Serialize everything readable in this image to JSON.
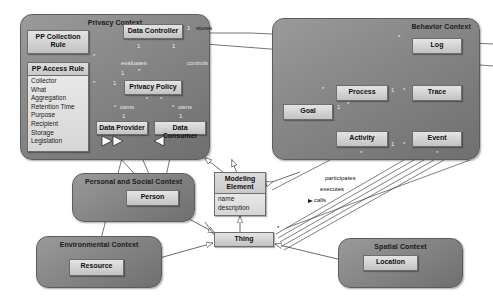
{
  "diagram": {
    "type": "uml-class-diagram",
    "colors": {
      "context_panel": "#8a8a8a",
      "class_box": "#d2d2d2",
      "border": "#6d6d6d",
      "background": "#ffffff",
      "label_text": "#101010",
      "label_text_on_dark": "#e8e8e8"
    }
  },
  "contexts": [
    {
      "id": "privacy",
      "title": "Privacy Context"
    },
    {
      "id": "behavior",
      "title": "Behavior Context"
    },
    {
      "id": "personal",
      "title": "Personal and Social Context"
    },
    {
      "id": "environmental",
      "title": "Environmental Context"
    },
    {
      "id": "spatial",
      "title": "Spatial Context"
    }
  ],
  "classes": {
    "pp_collection_rule": {
      "name": "PP Collection Rule",
      "attributes": []
    },
    "pp_access_rule": {
      "name": "PP Access Rule",
      "attributes": [
        "Collector",
        "What",
        "Aggregation",
        "Retention Time",
        "Purpose",
        "Recipient",
        "Storage",
        "Legislation"
      ]
    },
    "data_controller": {
      "name": "Data Controller",
      "attributes": []
    },
    "privacy_policy": {
      "name": "Privacy Policy",
      "attributes": []
    },
    "data_provider": {
      "name": "Data Provider",
      "attributes": []
    },
    "data_consumer": {
      "name": "Data Consumer",
      "attributes": []
    },
    "goal": {
      "name": "Goal",
      "attributes": []
    },
    "process": {
      "name": "Process",
      "attributes": []
    },
    "activity": {
      "name": "Activity",
      "attributes": []
    },
    "log": {
      "name": "Log",
      "attributes": []
    },
    "trace": {
      "name": "Trace",
      "attributes": []
    },
    "event": {
      "name": "Event",
      "attributes": []
    },
    "person": {
      "name": "Person",
      "attributes": []
    },
    "resource": {
      "name": "Resource",
      "attributes": []
    },
    "location": {
      "name": "Location",
      "attributes": []
    },
    "modeling_element": {
      "name": "Modeling Element",
      "attributes": [
        "name",
        "description"
      ]
    },
    "thing": {
      "name": "Thing",
      "attributes": []
    }
  },
  "edge_labels": {
    "stores": "stores",
    "controls": "controls",
    "evaluates": "evaluates",
    "owns_left": "owns",
    "owns_right": "owns",
    "participates": "participates",
    "executes": "executes",
    "calls": "calls"
  },
  "multiplicities": {
    "dc_stores_one": "1",
    "dc_pp_one": "1",
    "dc_controls_one": "1",
    "evaluates_star": "*",
    "evaluates_one": "1",
    "collection_star": "*",
    "access_star": "*",
    "access_one": "1",
    "pp_star_left": "*",
    "pp_star_right": "*",
    "owns_left_star": "*",
    "owns_right_star": "*",
    "provider_one": "1",
    "consumer_one": "1",
    "goal_one": "1",
    "goal_star": "*",
    "process_one": "1",
    "trace_star": "*",
    "log_star": "*",
    "activity_star": "*",
    "event_star": "*",
    "activity_one": "1",
    "behavior_star": "*",
    "thing_star": "*"
  }
}
